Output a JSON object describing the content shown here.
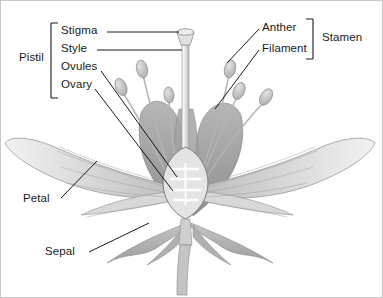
{
  "diagram": {
    "view": "longitudinal cross-section",
    "style": "grayscale pencil-shaded botanical illustration",
    "border_color": "#c8c8c8",
    "background_color": "#ffffff",
    "text_color": "#1a1a1a",
    "leader_line_color": "#000000"
  },
  "groups": [
    {
      "id": "pistil",
      "label": "Pistil",
      "bracket_side": "left",
      "members": [
        "Stigma",
        "Style",
        "Ovules",
        "Ovary"
      ]
    },
    {
      "id": "stamen",
      "label": "Stamen",
      "bracket_side": "right",
      "members": [
        "Anther",
        "Filament"
      ]
    }
  ],
  "labels": [
    {
      "id": "pistil",
      "text": "Pistil",
      "x": 18,
      "y": 57,
      "leader": false
    },
    {
      "id": "stigma",
      "text": "Stigma",
      "x": 60,
      "y": 31,
      "leader": true
    },
    {
      "id": "style",
      "text": "Style",
      "x": 60,
      "y": 49,
      "leader": true
    },
    {
      "id": "ovules",
      "text": "Ovules",
      "x": 60,
      "y": 67,
      "leader": true
    },
    {
      "id": "ovary",
      "text": "Ovary",
      "x": 60,
      "y": 85,
      "leader": true
    },
    {
      "id": "anther",
      "text": "Anther",
      "x": 262,
      "y": 27,
      "leader": true
    },
    {
      "id": "filament",
      "text": "Filament",
      "x": 262,
      "y": 45,
      "leader": true
    },
    {
      "id": "stamen",
      "text": "Stamen",
      "x": 322,
      "y": 36,
      "leader": false
    },
    {
      "id": "petal",
      "text": "Petal",
      "x": 22,
      "y": 200,
      "leader": true
    },
    {
      "id": "sepal",
      "text": "Sepal",
      "x": 44,
      "y": 254,
      "leader": true
    }
  ],
  "parts": {
    "stigma": {
      "name": "Stigma",
      "description": "flared sticky cap at top of style"
    },
    "style": {
      "name": "Style",
      "description": "slender column connecting stigma to ovary"
    },
    "ovules": {
      "name": "Ovules",
      "description": "four ladder-like rungs inside ovary chamber",
      "count": 4
    },
    "ovary": {
      "name": "Ovary",
      "description": "swollen oval chamber at base of pistil"
    },
    "anther": {
      "name": "Anther",
      "description": "pollen-bearing oval sac atop filament",
      "count": 6
    },
    "filament": {
      "name": "Filament",
      "description": "slender curved stalk supporting anther",
      "count": 6
    },
    "petal": {
      "name": "Petal",
      "description": "broad spreading veined perianth segment",
      "count": 5
    },
    "sepal": {
      "name": "Sepal",
      "description": "pointed green-grey segment below petals",
      "count": 4
    },
    "stem": {
      "name": "Stem",
      "description": "tapering stalk below receptacle"
    }
  },
  "palette": {
    "petal_light": "#e9e9e9",
    "petal_mid": "#d2d2d2",
    "petal_dark": "#a8a8a8",
    "petal_back": "#9a9a9a",
    "sepal": "#b4b4b4",
    "style": "#dcdcdc",
    "anther": "#c0c0c0",
    "outline": "#8c8c8c",
    "vein": "#9e9e9e"
  }
}
